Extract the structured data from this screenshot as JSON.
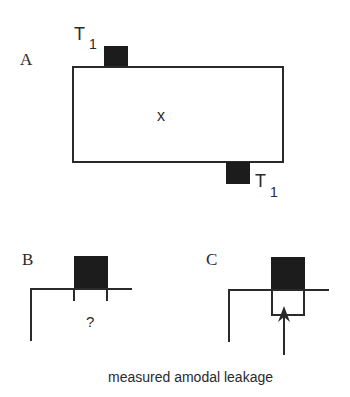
{
  "panels": {
    "a": {
      "label": "A",
      "center_symbol": "x",
      "target_top": {
        "label": "T",
        "subscript": "1"
      },
      "target_bottom": {
        "label": "T",
        "subscript": "1"
      }
    },
    "b": {
      "label": "B",
      "unknown_marker": "?"
    },
    "c": {
      "label": "C",
      "annotation": "measured amodal leakage"
    }
  },
  "colors": {
    "ink": "#2a2a2a",
    "target_fill": "#1c1c1c",
    "background": "#ffffff"
  }
}
